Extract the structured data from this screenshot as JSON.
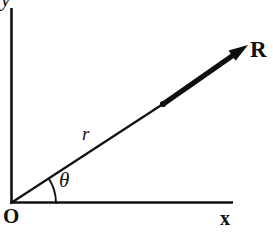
{
  "figure": {
    "background_color": "#ffffff",
    "ink_color": "#111111",
    "width": 273,
    "height": 233
  },
  "axes": {
    "origin": {
      "x": 11,
      "y": 203
    },
    "x_axis": {
      "label": "x",
      "from": {
        "x": 11,
        "y": 203
      },
      "to": {
        "x": 233,
        "y": 203
      }
    },
    "y_axis": {
      "label": "y",
      "from": {
        "x": 11,
        "y": 203
      },
      "to": {
        "x": 11,
        "y": 8
      }
    },
    "origin_label": "O"
  },
  "vector": {
    "label": "R",
    "magnitude_label": "r",
    "angle_label": "θ",
    "tail": {
      "x": 11,
      "y": 203
    },
    "node": {
      "x": 163,
      "y": 104
    },
    "tip": {
      "x": 248,
      "y": 45
    },
    "angle_degrees": 33,
    "thin_color": "#111111",
    "thick_color": "#0d0d0d"
  },
  "arc": {
    "radius": 45,
    "start_angle_degrees": 0,
    "end_angle_degrees": 33
  }
}
